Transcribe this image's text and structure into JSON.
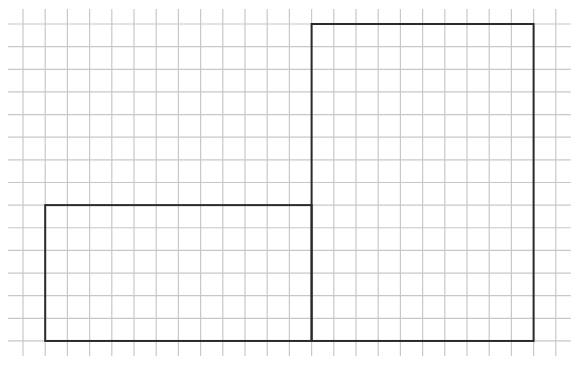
{
  "diagram": {
    "type": "grid-shapes",
    "grid": {
      "columns": 24,
      "rows": 14,
      "origin_px": [
        23,
        24
      ],
      "cell_w_px": 22.2,
      "cell_h_px": 22.64,
      "extend_px": 15,
      "line_color": "#c8c8c8"
    },
    "shapes": [
      {
        "name": "left-rectangle",
        "col": 1,
        "row": 8,
        "width_cells": 12,
        "height_cells": 6,
        "stroke": "#2a2a2a"
      },
      {
        "name": "right-rectangle",
        "col": 13,
        "row": 0,
        "width_cells": 10,
        "height_cells": 14,
        "stroke": "#2a2a2a"
      }
    ]
  }
}
